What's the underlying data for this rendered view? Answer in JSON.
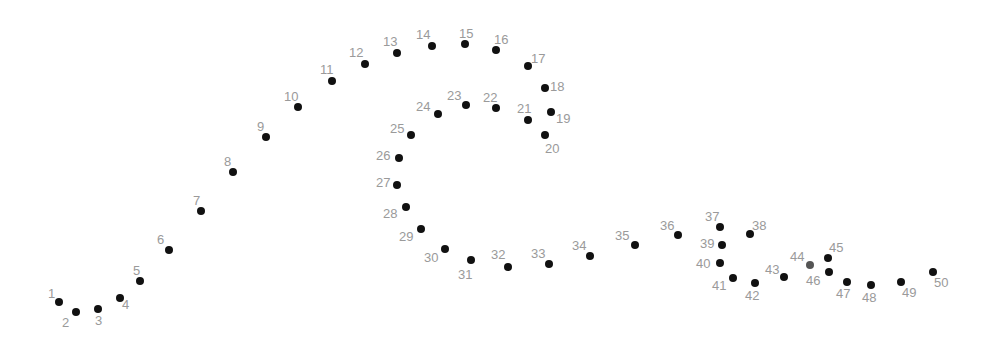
{
  "puzzle": {
    "type": "connect-the-dots",
    "dot_color": "#111111",
    "label_color": "#9a9a9a",
    "dots": [
      {
        "n": "1",
        "x": 59,
        "y": 302,
        "lx": 48,
        "ly": 287
      },
      {
        "n": "2",
        "x": 76,
        "y": 312,
        "lx": 62,
        "ly": 316
      },
      {
        "n": "3",
        "x": 98,
        "y": 309,
        "lx": 95,
        "ly": 314
      },
      {
        "n": "4",
        "x": 120,
        "y": 298,
        "lx": 122,
        "ly": 298
      },
      {
        "n": "5",
        "x": 140,
        "y": 281,
        "lx": 133,
        "ly": 264
      },
      {
        "n": "6",
        "x": 169,
        "y": 250,
        "lx": 157,
        "ly": 233
      },
      {
        "n": "7",
        "x": 201,
        "y": 211,
        "lx": 193,
        "ly": 194
      },
      {
        "n": "8",
        "x": 233,
        "y": 172,
        "lx": 224,
        "ly": 155
      },
      {
        "n": "9",
        "x": 266,
        "y": 137,
        "lx": 257,
        "ly": 120
      },
      {
        "n": "10",
        "x": 298,
        "y": 107,
        "lx": 284,
        "ly": 90
      },
      {
        "n": "11",
        "x": 332,
        "y": 81,
        "lx": 320,
        "ly": 63
      },
      {
        "n": "12",
        "x": 365,
        "y": 64,
        "lx": 349,
        "ly": 46
      },
      {
        "n": "13",
        "x": 397,
        "y": 53,
        "lx": 383,
        "ly": 35
      },
      {
        "n": "14",
        "x": 432,
        "y": 46,
        "lx": 416,
        "ly": 28
      },
      {
        "n": "15",
        "x": 465,
        "y": 44,
        "lx": 459,
        "ly": 27
      },
      {
        "n": "16",
        "x": 496,
        "y": 50,
        "lx": 494,
        "ly": 33
      },
      {
        "n": "17",
        "x": 528,
        "y": 66,
        "lx": 531,
        "ly": 52
      },
      {
        "n": "18",
        "x": 545,
        "y": 88,
        "lx": 550,
        "ly": 80
      },
      {
        "n": "19",
        "x": 551,
        "y": 112,
        "lx": 556,
        "ly": 112
      },
      {
        "n": "20",
        "x": 545,
        "y": 135,
        "lx": 545,
        "ly": 142
      },
      {
        "n": "21",
        "x": 528,
        "y": 120,
        "lx": 517,
        "ly": 102
      },
      {
        "n": "22",
        "x": 496,
        "y": 108,
        "lx": 483,
        "ly": 91
      },
      {
        "n": "23",
        "x": 466,
        "y": 105,
        "lx": 447,
        "ly": 89
      },
      {
        "n": "24",
        "x": 438,
        "y": 114,
        "lx": 416,
        "ly": 100
      },
      {
        "n": "25",
        "x": 411,
        "y": 135,
        "lx": 390,
        "ly": 122
      },
      {
        "n": "26",
        "x": 399,
        "y": 158,
        "lx": 376,
        "ly": 149
      },
      {
        "n": "27",
        "x": 397,
        "y": 185,
        "lx": 376,
        "ly": 176
      },
      {
        "n": "28",
        "x": 406,
        "y": 207,
        "lx": 383,
        "ly": 207
      },
      {
        "n": "29",
        "x": 421,
        "y": 229,
        "lx": 399,
        "ly": 230
      },
      {
        "n": "30",
        "x": 445,
        "y": 249,
        "lx": 424,
        "ly": 251
      },
      {
        "n": "31",
        "x": 471,
        "y": 260,
        "lx": 458,
        "ly": 268
      },
      {
        "n": "32",
        "x": 508,
        "y": 267,
        "lx": 491,
        "ly": 248
      },
      {
        "n": "33",
        "x": 549,
        "y": 264,
        "lx": 531,
        "ly": 247
      },
      {
        "n": "34",
        "x": 590,
        "y": 256,
        "lx": 572,
        "ly": 239
      },
      {
        "n": "35",
        "x": 635,
        "y": 245,
        "lx": 615,
        "ly": 229
      },
      {
        "n": "36",
        "x": 678,
        "y": 235,
        "lx": 660,
        "ly": 219
      },
      {
        "n": "37",
        "x": 720,
        "y": 227,
        "lx": 705,
        "ly": 210
      },
      {
        "n": "38",
        "x": 750,
        "y": 234,
        "lx": 752,
        "ly": 219
      },
      {
        "n": "39",
        "x": 722,
        "y": 245,
        "lx": 700,
        "ly": 237
      },
      {
        "n": "40",
        "x": 720,
        "y": 263,
        "lx": 696,
        "ly": 257
      },
      {
        "n": "41",
        "x": 733,
        "y": 278,
        "lx": 712,
        "ly": 279
      },
      {
        "n": "42",
        "x": 755,
        "y": 283,
        "lx": 745,
        "ly": 289
      },
      {
        "n": "43",
        "x": 784,
        "y": 277,
        "lx": 765,
        "ly": 263
      },
      {
        "n": "44",
        "x": 810,
        "y": 265,
        "lx": 790,
        "ly": 250,
        "gray": true
      },
      {
        "n": "45",
        "x": 828,
        "y": 258,
        "lx": 829,
        "ly": 241
      },
      {
        "n": "46",
        "x": 829,
        "y": 272,
        "lx": 806,
        "ly": 274
      },
      {
        "n": "47",
        "x": 847,
        "y": 282,
        "lx": 836,
        "ly": 287
      },
      {
        "n": "48",
        "x": 871,
        "y": 285,
        "lx": 862,
        "ly": 291
      },
      {
        "n": "49",
        "x": 901,
        "y": 282,
        "lx": 902,
        "ly": 286
      },
      {
        "n": "50",
        "x": 933,
        "y": 272,
        "lx": 934,
        "ly": 276
      }
    ]
  }
}
